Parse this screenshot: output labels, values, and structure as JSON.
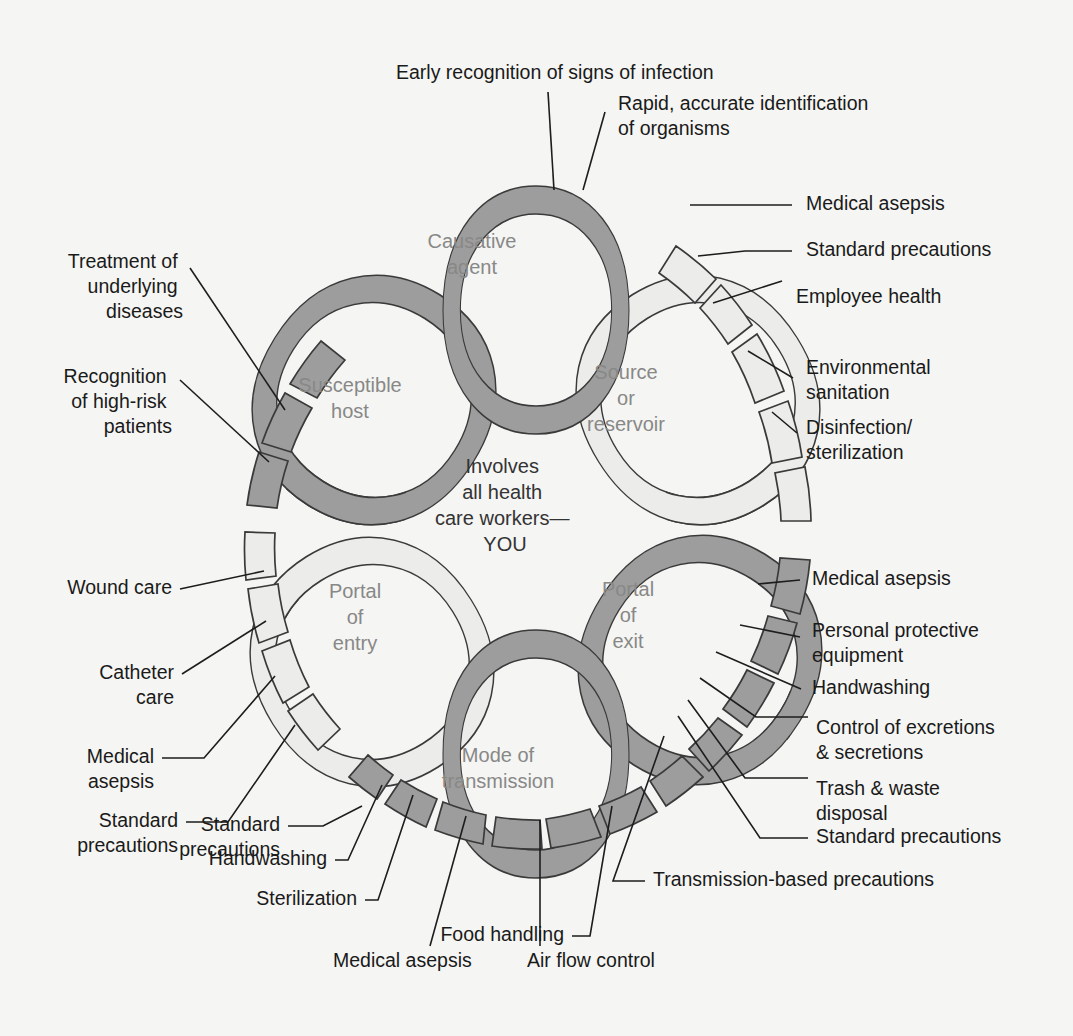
{
  "diagram": {
    "center_text": [
      "Involves",
      "all health",
      "care workers—",
      "YOU"
    ],
    "colors": {
      "background": "#f5f5f3",
      "link_dark": "#9d9d9d",
      "link_light": "#ececea",
      "outline": "#3a3a3a",
      "ring_label": "#888887",
      "label_text": "#1a1a1a",
      "center_text": "#333333"
    },
    "links": [
      {
        "id": "causative-agent",
        "label": [
          "Causative",
          "agent"
        ],
        "shade": "dark"
      },
      {
        "id": "source-or-reservoir",
        "label": [
          "Source",
          "or",
          "reservoir"
        ],
        "shade": "light"
      },
      {
        "id": "portal-of-exit",
        "label": [
          "Portal",
          "of",
          "exit"
        ],
        "shade": "dark"
      },
      {
        "id": "mode-of-transmission",
        "label": [
          "Mode of",
          "transmission"
        ],
        "shade": "dark"
      },
      {
        "id": "portal-of-entry",
        "label": [
          "Portal",
          "of",
          "entry"
        ],
        "shade": "light"
      },
      {
        "id": "susceptible-host",
        "label": [
          "Susceptible",
          "host"
        ],
        "shade": "dark"
      }
    ],
    "callouts": {
      "top": [
        {
          "id": "early-recognition",
          "text": [
            "Early recognition of signs of infection"
          ]
        },
        {
          "id": "rapid-identification",
          "text": [
            "Rapid, accurate identification",
            "of organisms"
          ]
        }
      ],
      "upper_right": [
        {
          "id": "medical-asepsis-1",
          "text": [
            "Medical asepsis"
          ]
        },
        {
          "id": "standard-precautions-1",
          "text": [
            "Standard precautions"
          ]
        },
        {
          "id": "employee-health",
          "text": [
            "Employee health"
          ]
        },
        {
          "id": "environmental-sanitation",
          "text": [
            "Environmental",
            "sanitation"
          ]
        },
        {
          "id": "disinfection-sterilization",
          "text": [
            "Disinfection/",
            "sterilization"
          ]
        }
      ],
      "lower_right": [
        {
          "id": "medical-asepsis-2",
          "text": [
            "Medical asepsis"
          ]
        },
        {
          "id": "personal-protective-equipment",
          "text": [
            "Personal protective",
            "equipment"
          ]
        },
        {
          "id": "handwashing-1",
          "text": [
            "Handwashing"
          ]
        },
        {
          "id": "control-of-excretions",
          "text": [
            "Control of excretions",
            "& secretions"
          ]
        },
        {
          "id": "trash-waste-disposal",
          "text": [
            "Trash & waste",
            "disposal"
          ]
        },
        {
          "id": "standard-precautions-2",
          "text": [
            "Standard precautions"
          ]
        },
        {
          "id": "transmission-based-precautions",
          "text": [
            "Transmission-based precautions"
          ]
        }
      ],
      "bottom": [
        {
          "id": "food-handling",
          "text": [
            "Food handling"
          ]
        },
        {
          "id": "air-flow-control",
          "text": [
            "Air flow control"
          ]
        },
        {
          "id": "medical-asepsis-3",
          "text": [
            "Medical asepsis"
          ]
        },
        {
          "id": "sterilization",
          "text": [
            "Sterilization"
          ]
        },
        {
          "id": "handwashing-2",
          "text": [
            "Handwashing"
          ]
        },
        {
          "id": "standard-precautions-3",
          "text": [
            "Standard",
            "precautions"
          ]
        }
      ],
      "lower_left": [
        {
          "id": "standard-precautions-4",
          "text": [
            "Standard",
            "precautions"
          ]
        },
        {
          "id": "medical-asepsis-4",
          "text": [
            "Medical",
            "asepsis"
          ]
        },
        {
          "id": "catheter-care",
          "text": [
            "Catheter",
            "care"
          ]
        },
        {
          "id": "wound-care",
          "text": [
            "Wound care"
          ]
        }
      ],
      "upper_left": [
        {
          "id": "recognition-high-risk",
          "text": [
            "Recognition",
            "of high-risk",
            "patients"
          ]
        },
        {
          "id": "treatment-underlying",
          "text": [
            "Treatment of",
            "underlying",
            "diseases"
          ]
        }
      ]
    }
  }
}
